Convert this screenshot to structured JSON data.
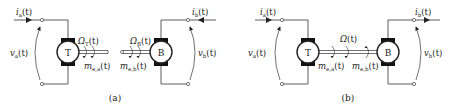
{
  "diagram": {
    "panels": [
      {
        "caption": "(a)",
        "left_motor": "T",
        "right_motor": "B",
        "i_left": "i",
        "i_left_sub": "a",
        "i_right": "i",
        "i_right_sub": "b",
        "v_left": "v",
        "v_left_sub": "a",
        "v_right": "v",
        "v_right_sub": "b",
        "omega_left": "Ω",
        "omega_left_sub": "T",
        "omega_right": "Ω",
        "omega_right_sub": "B",
        "m_left": "m",
        "m_left_sub": "e,a",
        "m_right": "m",
        "m_right_sub": "e,b",
        "t": "(t)",
        "shaft": "decoupled"
      },
      {
        "caption": "(b)",
        "left_motor": "T",
        "right_motor": "B",
        "i_left": "i",
        "i_left_sub": "a",
        "i_right": "i",
        "i_right_sub": "b",
        "v_left": "v",
        "v_left_sub": "a",
        "v_right": "v",
        "v_right_sub": "b",
        "omega": "Ω",
        "m_left": "m",
        "m_left_sub": "e,a",
        "m_right": "m",
        "m_right_sub": "e,b",
        "t": "(t)",
        "shaft": "coupled"
      }
    ]
  }
}
